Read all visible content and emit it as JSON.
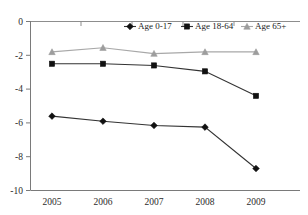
{
  "chart_data": {
    "type": "line",
    "title": "",
    "xlabel": "",
    "ylabel": "",
    "categories": [
      "2005",
      "2006",
      "2007",
      "2008",
      "2009"
    ],
    "ylim": [
      -10,
      0
    ],
    "yticks": [
      "0",
      "-2",
      "-4",
      "-6",
      "-8",
      "-10"
    ],
    "ytick_values": [
      0,
      -2,
      -4,
      -6,
      -8,
      -10
    ],
    "grid": false,
    "legend_position": "top-right",
    "series": [
      {
        "name": "Age 0-17",
        "marker": "diamond",
        "color": "#111111",
        "values": [
          -5.6,
          -5.9,
          -6.15,
          -6.25,
          -8.7
        ]
      },
      {
        "name": "Age 18-64",
        "marker": "square",
        "color": "#111111",
        "values": [
          -2.5,
          -2.5,
          -2.6,
          -2.95,
          -4.4
        ]
      },
      {
        "name": "Age 65+",
        "marker": "triangle",
        "color": "#9d9d9d",
        "values": [
          -1.8,
          -1.55,
          -1.9,
          -1.8,
          -1.8
        ]
      }
    ]
  },
  "legend": {
    "items": [
      {
        "label": "Age 0-17"
      },
      {
        "label": "Age 18-64"
      },
      {
        "label": "Age 65+"
      }
    ]
  },
  "axes": {
    "y_ticks": [
      "0",
      "-2",
      "-4",
      "-6",
      "-8",
      "-10"
    ],
    "x_ticks": [
      "2005",
      "2006",
      "2007",
      "2008",
      "2009"
    ]
  },
  "top_note": ""
}
